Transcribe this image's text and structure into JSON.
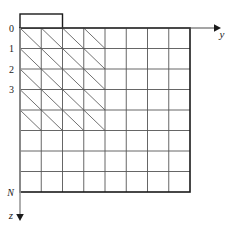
{
  "figure": {
    "title": "",
    "background_color": "#ffffff",
    "grid_line_color": "#555555",
    "border_color": "#1a1a1a",
    "hatch_line_color": "#333333",
    "axis_color": "#4d4d4d",
    "text_color": "#1a1a1a"
  },
  "grid": {
    "columns": 8,
    "rows": 8,
    "left": 20,
    "top": 28,
    "cell_width": 21.25,
    "cell_height": 20.5
  },
  "tab": {
    "label": "",
    "start_column": 0,
    "span_columns": 2,
    "height": 14
  },
  "axes": {
    "horizontal": {
      "name": "y",
      "label": "y",
      "label_x": 222,
      "label_y": 38,
      "arrow_end_x": 214,
      "arrow_y": 28
    },
    "vertical": {
      "name": "z",
      "label": "z",
      "label_x": 11,
      "label_y": 219,
      "arrow_end_y": 214,
      "arrow_x": 20
    }
  },
  "row_labels": [
    {
      "text": "0",
      "row": 0,
      "italic": false
    },
    {
      "text": "1",
      "row": 1,
      "italic": false
    },
    {
      "text": "2",
      "row": 2,
      "italic": false
    },
    {
      "text": "3",
      "row": 3,
      "italic": false
    },
    {
      "text": "N",
      "row": 8,
      "italic": true
    }
  ],
  "hatching": {
    "direction": "nw-se",
    "description": "diagonal lines from upper-left to lower-right filling a staircase region",
    "rows": [
      {
        "row": 0,
        "start_column": 0,
        "end_column": 4
      },
      {
        "row": 1,
        "start_column": 0,
        "end_column": 4
      },
      {
        "row": 2,
        "start_column": 0,
        "end_column": 4
      },
      {
        "row": 3,
        "start_column": 0,
        "end_column": 4
      },
      {
        "row": 4,
        "start_column": 0,
        "end_column": 4
      }
    ]
  },
  "chart_data": {
    "type": "table",
    "title": "",
    "xlabel": "y",
    "ylabel": "z",
    "categories": [
      "0",
      "1",
      "2",
      "3",
      "N"
    ],
    "values": [
      4,
      4,
      4,
      4,
      4
    ],
    "grid": true,
    "legend": "none"
  }
}
